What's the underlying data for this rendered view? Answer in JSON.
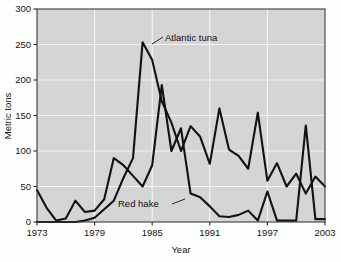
{
  "chart_data": {
    "type": "line",
    "title": "",
    "xlabel": "Year",
    "ylabel": "Metric tons",
    "xlim": [
      1973,
      2003
    ],
    "ylim": [
      0,
      300
    ],
    "xticks": [
      1973,
      1979,
      1985,
      1991,
      1997,
      2003
    ],
    "xtick_labels": [
      "1973",
      "1979",
      "1985",
      "1991",
      "1997",
      "2003"
    ],
    "yticks": [
      0,
      50,
      100,
      150,
      200,
      250,
      300
    ],
    "ytick_labels": [
      "0",
      "50",
      "100",
      "150",
      "200",
      "250",
      "300"
    ],
    "grid": true,
    "grid_color": "#f4f4f4",
    "plot_background": "#d5d5d5",
    "line_color": "#111111",
    "legend": "annotations",
    "legend_position": "inline-annotations",
    "x": [
      1973,
      1974,
      1975,
      1976,
      1977,
      1978,
      1979,
      1980,
      1981,
      1982,
      1983,
      1984,
      1985,
      1986,
      1987,
      1988,
      1989,
      1990,
      1991,
      1992,
      1993,
      1994,
      1995,
      1996,
      1997,
      1998,
      1999,
      2000,
      2001,
      2002,
      2003
    ],
    "series": [
      {
        "name": "Atlantic tuna",
        "annotation": "Atlantic tuna",
        "values": [
          0,
          0,
          0,
          0,
          0,
          2,
          6,
          18,
          30,
          62,
          90,
          253,
          228,
          170,
          140,
          100,
          135,
          120,
          82,
          160,
          102,
          93,
          75,
          154,
          58,
          83,
          50,
          68,
          40,
          64,
          50
        ]
      },
      {
        "name": "Red hake",
        "annotation": "Red hake",
        "values": [
          45,
          20,
          2,
          5,
          30,
          14,
          16,
          32,
          90,
          80,
          65,
          50,
          80,
          193,
          100,
          132,
          40,
          35,
          22,
          8,
          7,
          10,
          16,
          2,
          43,
          2,
          2,
          2,
          136,
          4,
          4
        ]
      }
    ],
    "annotations": [
      {
        "text": "Atlantic tuna",
        "series": "Atlantic tuna",
        "anchor_year": 1984,
        "anchor_value": 253
      },
      {
        "text": "Red hake",
        "series": "Red hake",
        "anchor_year": 1990,
        "anchor_value": 35
      }
    ]
  }
}
